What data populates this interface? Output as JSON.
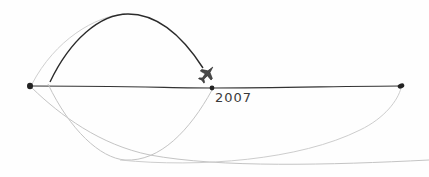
{
  "sketch": {
    "description": "Hand-drawn timeline with arcs and an airplane landing on a point",
    "timeline": {
      "points": [
        {
          "id": "start",
          "x": 30,
          "y": 86
        },
        {
          "id": "middle",
          "x": 212,
          "y": 88,
          "label": "2007"
        },
        {
          "id": "end",
          "x": 401,
          "y": 86
        }
      ]
    },
    "labels": {
      "year": "2007"
    },
    "colors": {
      "ink_dark": "#2b2b2b",
      "ink_light": "#c4c4c4",
      "background": "#fefefe"
    }
  }
}
